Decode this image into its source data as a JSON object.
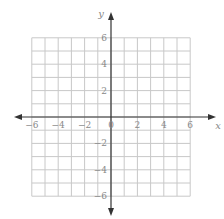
{
  "diagram": {
    "type": "coordinate-grid",
    "x_label": "x",
    "y_label": "y",
    "range": [
      -6,
      6
    ],
    "x_ticks": [
      "−6",
      "−4",
      "−2",
      "0",
      "2",
      "4",
      "6"
    ],
    "y_ticks_pos": [
      "6",
      "4",
      "2"
    ],
    "y_ticks_neg": [
      "−2",
      "−4",
      "−6"
    ],
    "colors": {
      "grid": "#c8c8c8",
      "axis": "#333333",
      "label": "#888888"
    }
  }
}
